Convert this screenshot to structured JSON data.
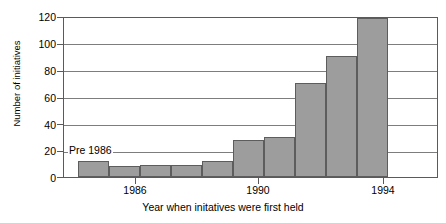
{
  "chart_data": {
    "type": "bar",
    "title": "",
    "xlabel": "Year when initatives were first held",
    "ylabel": "Number of initiatives",
    "categories": [
      "Pre 1986",
      "1986",
      "1987",
      "1988",
      "1989",
      "1990",
      "1991",
      "1992",
      "1993",
      "1994"
    ],
    "values": [
      12,
      8,
      9,
      9,
      12,
      28,
      30,
      71,
      91,
      120
    ],
    "ylim": [
      0,
      120
    ],
    "yticks": [
      0,
      20,
      40,
      60,
      80,
      100,
      120
    ],
    "ytick_labels": [
      "0",
      "20",
      "40",
      "60",
      "80",
      "100",
      "120"
    ],
    "xtick_labels": [
      "1986",
      "1990",
      "1994"
    ],
    "xtick_categories": [
      "1986",
      "1990",
      "1994"
    ],
    "grid": "horizontal",
    "legend": "none",
    "annotations": [
      {
        "text": "Pre 1986",
        "target_category": "Pre 1986"
      }
    ],
    "bar_fill_color": "#9d9d9d",
    "bar_edge_color": "#5d5d5d",
    "axis_color": "#5a5a5a",
    "grid_color": "#7d7d7d",
    "background_color": "#ffffff"
  }
}
